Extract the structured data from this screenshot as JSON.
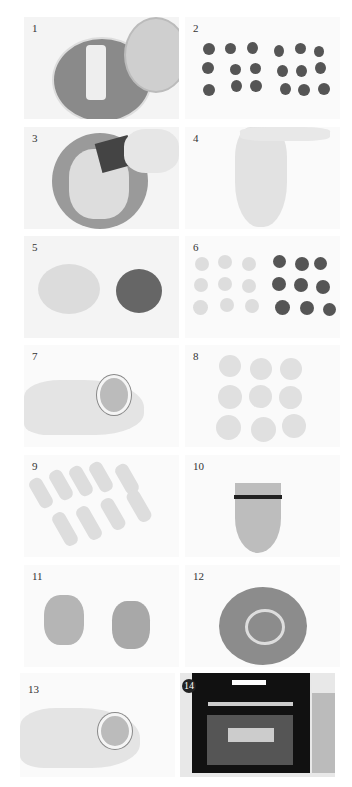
{
  "steps": [
    {
      "number": "1",
      "description": "food processor with chopped filling and bowl of liquid"
    },
    {
      "number": "2",
      "description": "18 dark filling balls"
    },
    {
      "number": "3",
      "description": "mixing dough in bowl with scraper"
    },
    {
      "number": "4",
      "description": "stretchy dough held by hand"
    },
    {
      "number": "5",
      "description": "light dough and dark dough"
    },
    {
      "number": "6",
      "description": "9 light and 9 dark dough balls"
    },
    {
      "number": "7",
      "description": "wrapping dough in hand"
    },
    {
      "number": "8",
      "description": "9 wrapped dough balls"
    },
    {
      "number": "9",
      "description": "9 rolled dough logs"
    },
    {
      "number": "10",
      "description": "flattened dough with rolling pin"
    },
    {
      "number": "11",
      "description": "two rolled spirals"
    },
    {
      "number": "12",
      "description": "flattened spiral dough"
    },
    {
      "number": "13",
      "description": "wrapping filling in spiral dough"
    },
    {
      "number": "14",
      "description": "baking in oven"
    }
  ],
  "colors": {
    "background": "#ffffff",
    "panel": "#f4f4f4",
    "dark_dough": "#555555",
    "light_dough": "#d8d8d8"
  }
}
